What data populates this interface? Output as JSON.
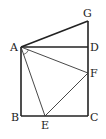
{
  "diagram": {
    "type": "geometry",
    "points": {
      "A": {
        "label": "A",
        "x": 21,
        "y": 47
      },
      "B": {
        "label": "B",
        "x": 21,
        "y": 116
      },
      "C": {
        "label": "C",
        "x": 88,
        "y": 116
      },
      "D": {
        "label": "D",
        "x": 88,
        "y": 47
      },
      "E": {
        "label": "E",
        "x": 45,
        "y": 116
      },
      "F": {
        "label": "F",
        "x": 88,
        "y": 73
      },
      "G": {
        "label": "G",
        "x": 88,
        "y": 21
      }
    },
    "segments": [
      {
        "from": "A",
        "to": "B",
        "weight": "thick"
      },
      {
        "from": "B",
        "to": "C",
        "weight": "thick"
      },
      {
        "from": "C",
        "to": "G",
        "weight": "thick"
      },
      {
        "from": "A",
        "to": "D",
        "weight": "thick"
      },
      {
        "from": "A",
        "to": "G",
        "weight": "thick"
      },
      {
        "from": "A",
        "to": "E",
        "weight": "thin"
      },
      {
        "from": "A",
        "to": "F",
        "weight": "thin"
      },
      {
        "from": "E",
        "to": "F",
        "weight": "thin"
      }
    ],
    "angle_marks": [
      {
        "vertex": "A",
        "between": [
          "E",
          "F"
        ]
      }
    ],
    "colors": {
      "stroke": "#222222",
      "background": "#ffffff"
    }
  }
}
